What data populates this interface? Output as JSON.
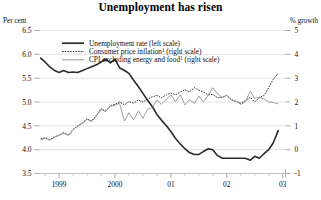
{
  "chart_data": {
    "type": "line",
    "title": "Unemployment has risen",
    "left_axis": {
      "label": "Per cent",
      "ticks": [
        6.5,
        6.0,
        5.5,
        5.0,
        4.5,
        4.0,
        3.5
      ],
      "tick_labels": [
        "6.5",
        "6.0",
        "5.5",
        "5.0",
        "4.5",
        "4.0",
        "3.5"
      ],
      "ylim": [
        3.5,
        6.5
      ]
    },
    "right_axis": {
      "label": "% growth",
      "ticks": [
        5,
        4,
        3,
        2,
        1,
        0,
        -1
      ],
      "tick_labels": [
        "5",
        "4",
        "3",
        "2",
        "1",
        "0",
        "-1"
      ],
      "ylim": [
        -1,
        5
      ]
    },
    "xlabel": "",
    "x_tick_labels": [
      "1999",
      "2000",
      "01",
      "02",
      "03"
    ],
    "x_tick_values": [
      1999.0,
      2000.0,
      2001.0,
      2002.0,
      2003.0
    ],
    "xlim": [
      1998.65,
      2003.05
    ],
    "grid": "horizontal-light",
    "legend_position": "top-center-inside",
    "series": [
      {
        "name": "Unemployment rate (left scale)",
        "axis": "left",
        "style": "solid-thick-dark",
        "color": "#2b2b2b",
        "x": [
          1998.67,
          1998.75,
          1998.83,
          1998.92,
          1999.0,
          1999.08,
          1999.17,
          1999.25,
          1999.33,
          1999.42,
          1999.5,
          1999.58,
          1999.67,
          1999.75,
          1999.83,
          1999.92,
          2000.0,
          2000.08,
          2000.17,
          2000.25,
          2000.33,
          2000.42,
          2000.5,
          2000.58,
          2000.67,
          2000.75,
          2000.83,
          2000.92,
          2001.0,
          2001.08,
          2001.17,
          2001.25,
          2001.33,
          2001.42,
          2001.5,
          2001.58,
          2001.67,
          2001.75,
          2001.83,
          2001.92,
          2002.0,
          2002.08,
          2002.17,
          2002.25,
          2002.33,
          2002.42,
          2002.5,
          2002.58,
          2002.67,
          2002.75,
          2002.83,
          2002.92
        ],
        "values": [
          5.92,
          5.84,
          5.74,
          5.66,
          5.62,
          5.66,
          5.62,
          5.63,
          5.62,
          5.66,
          5.7,
          5.74,
          5.78,
          5.84,
          5.9,
          5.82,
          5.9,
          5.72,
          5.66,
          5.6,
          5.46,
          5.32,
          5.18,
          5.04,
          4.9,
          4.74,
          4.62,
          4.5,
          4.38,
          4.24,
          4.12,
          4.02,
          3.94,
          3.9,
          3.9,
          3.96,
          4.02,
          4.0,
          3.88,
          3.82,
          3.82,
          3.82,
          3.82,
          3.82,
          3.82,
          3.78,
          3.86,
          3.82,
          3.92,
          4.0,
          4.14,
          4.4
        ]
      },
      {
        "name": "Consumer price inflation (right scale)",
        "axis": "right",
        "style": "dotted",
        "color": "#3a3a3a",
        "footnote_marker": "1",
        "x": [
          1998.67,
          1998.75,
          1998.83,
          1998.92,
          1999.0,
          1999.08,
          1999.17,
          1999.25,
          1999.33,
          1999.42,
          1999.5,
          1999.58,
          1999.67,
          1999.75,
          1999.83,
          1999.92,
          2000.0,
          2000.08,
          2000.17,
          2000.25,
          2000.33,
          2000.42,
          2000.5,
          2000.58,
          2000.67,
          2000.75,
          2000.83,
          2000.92,
          2001.0,
          2001.08,
          2001.17,
          2001.25,
          2001.33,
          2001.42,
          2001.5,
          2001.58,
          2001.67,
          2001.75,
          2001.83,
          2001.92,
          2002.0,
          2002.08,
          2002.17,
          2002.25,
          2002.33,
          2002.42,
          2002.5,
          2002.58,
          2002.67,
          2002.75,
          2002.83,
          2002.92
        ],
        "values": [
          0.45,
          0.5,
          0.42,
          0.55,
          0.6,
          0.72,
          0.62,
          0.85,
          1.0,
          1.12,
          1.3,
          1.2,
          1.45,
          1.72,
          1.62,
          1.85,
          1.9,
          2.0,
          1.88,
          2.02,
          1.95,
          2.08,
          2.0,
          2.12,
          2.22,
          2.28,
          2.18,
          2.3,
          2.38,
          2.3,
          2.42,
          2.52,
          2.42,
          2.6,
          2.5,
          2.42,
          2.3,
          2.32,
          2.18,
          2.2,
          2.28,
          2.1,
          2.02,
          1.95,
          2.05,
          2.2,
          2.0,
          2.18,
          2.28,
          2.6,
          2.95,
          3.2
        ]
      },
      {
        "name": "CPI excluding energy and food (right scale)",
        "axis": "right",
        "style": "solid-thin-grey",
        "color": "#8e8e8e",
        "footnote_marker": "1",
        "x": [
          1998.67,
          1998.75,
          1998.83,
          1998.92,
          1999.0,
          1999.08,
          1999.17,
          1999.25,
          1999.33,
          1999.42,
          1999.5,
          1999.58,
          1999.67,
          1999.75,
          1999.83,
          1999.92,
          2000.0,
          2000.08,
          2000.17,
          2000.25,
          2000.33,
          2000.42,
          2000.5,
          2000.58,
          2000.67,
          2000.75,
          2000.83,
          2000.92,
          2001.0,
          2001.08,
          2001.17,
          2001.25,
          2001.33,
          2001.42,
          2001.5,
          2001.58,
          2001.67,
          2001.75,
          2001.83,
          2001.92,
          2002.0,
          2002.08,
          2002.17,
          2002.25,
          2002.33,
          2002.42,
          2002.5,
          2002.58,
          2002.67,
          2002.75,
          2002.83,
          2002.92
        ],
        "values": [
          0.4,
          0.48,
          0.4,
          0.52,
          0.6,
          0.68,
          0.6,
          0.82,
          0.98,
          1.1,
          1.28,
          1.18,
          1.42,
          1.68,
          1.6,
          1.82,
          1.86,
          1.95,
          1.2,
          1.55,
          1.25,
          1.62,
          1.32,
          1.68,
          1.78,
          2.08,
          1.9,
          2.12,
          2.3,
          2.02,
          2.3,
          1.88,
          2.1,
          1.95,
          2.25,
          2.0,
          2.3,
          2.6,
          2.35,
          2.18,
          2.28,
          2.08,
          2.02,
          1.9,
          2.0,
          2.45,
          2.15,
          2.2,
          2.12,
          2.0,
          1.98,
          1.92
        ]
      }
    ],
    "legend_entries": [
      {
        "label": "Unemployment rate (left scale)",
        "style": "solid-thick-dark",
        "superscript": ""
      },
      {
        "label": "Consumer price inflation",
        "suffix": " (right scale)",
        "style": "dotted",
        "superscript": "1"
      },
      {
        "label": "CPI excluding energy and food",
        "suffix": " (right scale)",
        "style": "solid-thin-grey",
        "superscript": "1"
      }
    ]
  }
}
